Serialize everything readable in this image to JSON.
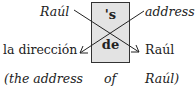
{
  "diagram": {
    "box": {
      "top": "'s",
      "bottom": "de",
      "fill": "#e3e3e3"
    },
    "english": {
      "possessor": "Raúl",
      "possessed": "address"
    },
    "spanish": {
      "possessed": "la dirección",
      "possessor": "Raúl"
    },
    "gloss": {
      "left": "(the address",
      "middle": "of",
      "right": "Raúl)"
    },
    "arrows": [
      {
        "from": "Raúl",
        "to": "Raúl",
        "direction": "upper-left to lower-right"
      },
      {
        "from": "address",
        "to": "la dirección",
        "direction": "upper-right to lower-left"
      }
    ]
  }
}
